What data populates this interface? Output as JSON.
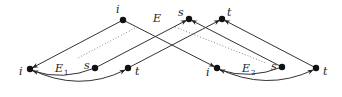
{
  "diagram": {
    "nodes": [
      {
        "id": "top_i",
        "label": "i",
        "x": 123,
        "y": 20,
        "lx": 116,
        "ly": 13
      },
      {
        "id": "top_s",
        "label": "s",
        "x": 189,
        "y": 19,
        "lx": 178,
        "ly": 16
      },
      {
        "id": "top_t",
        "label": "t",
        "x": 222,
        "y": 19,
        "lx": 227,
        "ly": 16
      },
      {
        "id": "left_i",
        "label": "i",
        "x": 30,
        "y": 69,
        "lx": 19,
        "ly": 75
      },
      {
        "id": "left_s",
        "label": "s",
        "x": 95,
        "y": 68,
        "lx": 84,
        "ly": 69
      },
      {
        "id": "left_t",
        "label": "t",
        "x": 128,
        "y": 68,
        "lx": 135,
        "ly": 75
      },
      {
        "id": "right_i",
        "label": "i",
        "x": 217,
        "y": 68,
        "lx": 206,
        "ly": 76
      },
      {
        "id": "right_s",
        "label": "s",
        "x": 282,
        "y": 67,
        "lx": 271,
        "ly": 70
      },
      {
        "id": "right_t",
        "label": "t",
        "x": 316,
        "y": 68,
        "lx": 323,
        "ly": 75
      }
    ],
    "region_labels": [
      {
        "id": "E",
        "text": "E",
        "sub": "",
        "x": 153,
        "y": 22
      },
      {
        "id": "E1",
        "text": "E",
        "sub": "1",
        "x": 55,
        "y": 72
      },
      {
        "id": "E2",
        "text": "E",
        "sub": "2",
        "x": 242,
        "y": 72
      }
    ],
    "edges": [
      {
        "from": "top_i",
        "to": "left_i",
        "type": "straight",
        "arrow": "end"
      },
      {
        "from": "top_i",
        "to": "right_i",
        "type": "straight",
        "arrow": "end"
      },
      {
        "from": "left_s",
        "to": "top_s",
        "type": "straight",
        "arrow": "end"
      },
      {
        "from": "left_t",
        "to": "top_t",
        "type": "straight",
        "arrow": "end"
      },
      {
        "from": "right_s",
        "to": "top_s",
        "type": "straight",
        "arrow": "end"
      },
      {
        "from": "right_t",
        "to": "top_t",
        "type": "straight",
        "arrow": "end"
      },
      {
        "from": "left_s",
        "to": "left_i",
        "type": "curve",
        "arrow": "end"
      },
      {
        "from": "left_i",
        "to": "left_t",
        "type": "curve",
        "arrow": "end"
      },
      {
        "from": "right_s",
        "to": "right_i",
        "type": "curve",
        "arrow": "end"
      },
      {
        "from": "right_i",
        "to": "right_t",
        "type": "curve",
        "arrow": "end"
      }
    ],
    "dotted_lines": [
      {
        "x1": 135,
        "y1": 28,
        "x2": 78,
        "y2": 58
      },
      {
        "x1": 175,
        "y1": 27,
        "x2": 266,
        "y2": 63
      }
    ]
  }
}
